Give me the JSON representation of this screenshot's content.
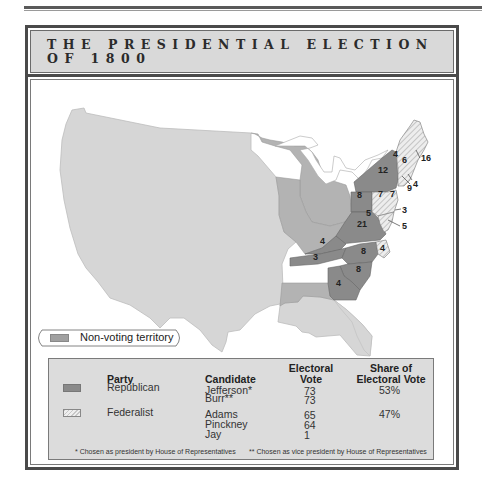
{
  "title": {
    "line1": "THE PRESIDENTIAL ELECTION",
    "line2": "OF 1800"
  },
  "colors": {
    "republican": "#8a8a8a",
    "federalist_hatch": "#c7c7c7",
    "non_voting": "#b3b3b3",
    "territory_unclaimed": "#d6d6d6",
    "frame": "#4a4a4a",
    "title_bg": "#d9d9d9",
    "table_bg": "#dcdcdc"
  },
  "map": {
    "state_labels": [
      {
        "state": "Vermont",
        "votes": "4",
        "party": "Federalist"
      },
      {
        "state": "New Hampshire",
        "votes": "6",
        "party": "Federalist"
      },
      {
        "state": "Massachusetts",
        "votes": "16",
        "party": "Federalist"
      },
      {
        "state": "Rhode Island",
        "votes": "4",
        "party": "Federalist"
      },
      {
        "state": "Connecticut",
        "votes": "9",
        "party": "Federalist"
      },
      {
        "state": "New York",
        "votes": "12",
        "party": "Republican"
      },
      {
        "state": "New Jersey",
        "votes": "7",
        "party": "Federalist"
      },
      {
        "state": "Pennsylvania (Republican)",
        "votes": "8",
        "party": "Republican"
      },
      {
        "state": "Pennsylvania (Federalist)",
        "votes": "7",
        "party": "Federalist"
      },
      {
        "state": "Delaware",
        "votes": "3",
        "party": "Federalist"
      },
      {
        "state": "Maryland (Federalist)",
        "votes": "5",
        "party": "Federalist"
      },
      {
        "state": "Maryland (Republican)",
        "votes": "5",
        "party": "Republican"
      },
      {
        "state": "Virginia",
        "votes": "21",
        "party": "Republican"
      },
      {
        "state": "Kentucky",
        "votes": "4",
        "party": "Republican"
      },
      {
        "state": "Tennessee",
        "votes": "3",
        "party": "Republican"
      },
      {
        "state": "North Carolina (Republican)",
        "votes": "8",
        "party": "Republican"
      },
      {
        "state": "North Carolina (Federalist)",
        "votes": "4",
        "party": "Federalist"
      },
      {
        "state": "South Carolina",
        "votes": "8",
        "party": "Republican"
      },
      {
        "state": "Georgia",
        "votes": "4",
        "party": "Republican"
      }
    ]
  },
  "legend": {
    "non_voting_label": "Non-voting territory"
  },
  "table": {
    "headers": {
      "party": "Party",
      "candidate": "Candidate",
      "electoral_vote_1": "Electoral",
      "electoral_vote_2": "Vote",
      "share_1": "Share of",
      "share_2": "Electoral Vote"
    },
    "rows": [
      {
        "party": "Republican",
        "candidates": [
          {
            "name": "Jefferson*",
            "votes": "73"
          },
          {
            "name": "Burr**",
            "votes": "73"
          }
        ],
        "share": "53%"
      },
      {
        "party": "Federalist",
        "candidates": [
          {
            "name": "Adams",
            "votes": "65"
          },
          {
            "name": "Pinckney",
            "votes": "64"
          },
          {
            "name": "Jay",
            "votes": "1"
          }
        ],
        "share": "47%"
      }
    ],
    "footnote_1": "* Chosen as president by House of Representatives",
    "footnote_2": "** Chosen as vice president by House of Representatives"
  }
}
